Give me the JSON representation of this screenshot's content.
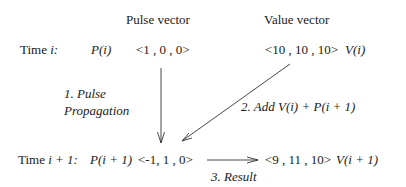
{
  "headers": {
    "pulse": "Pulse vector",
    "value": "Value vector"
  },
  "row_i": {
    "time_label": "Time ",
    "time_var": "i:",
    "pulse_name": "P(i)",
    "pulse_vec": "<1 , 0 , 0>",
    "value_vec": "<10 , 10 , 10>",
    "value_name": "V(i)"
  },
  "row_i1": {
    "time_label": "Time ",
    "time_var": "i + 1:",
    "pulse_name": "P(i + 1)",
    "pulse_vec": "<-1, 1 , 0>",
    "value_vec": "<9 , 11 , 10>",
    "value_name": "V(i + 1)"
  },
  "steps": {
    "step1_line1": "1. Pulse",
    "step1_line2": "Propagation",
    "step2": "2. Add V(i) + P(i + 1)",
    "step3": "3. Result"
  },
  "colors": {
    "text": "#1a1a1a",
    "arrow": "#333333"
  }
}
